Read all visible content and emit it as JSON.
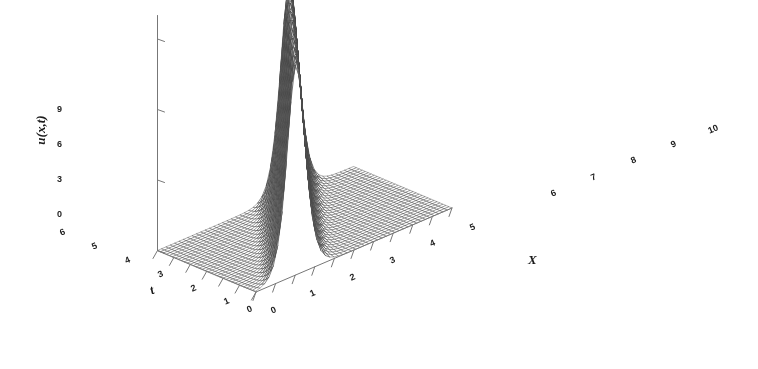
{
  "figure": {
    "type": "3d-surface-mesh",
    "background_color": "#ffffff",
    "mesh_color": "#4a4a4a",
    "axis_color": "#777777",
    "width": 758,
    "height": 369
  },
  "axes": {
    "z": {
      "label": "u(x,t)",
      "ticks": [
        "9",
        "6",
        "3",
        "0"
      ],
      "tick_values": [
        9,
        6,
        3,
        0
      ],
      "range": [
        0,
        10
      ]
    },
    "x": {
      "label": "X",
      "ticks": [
        "0",
        "1",
        "2",
        "3",
        "4",
        "5",
        "6",
        "7",
        "8",
        "9",
        "10"
      ],
      "tick_values": [
        0,
        1,
        2,
        3,
        4,
        5,
        6,
        7,
        8,
        9,
        10
      ],
      "range": [
        0,
        10
      ]
    },
    "t": {
      "label": "t",
      "ticks": [
        "0",
        "1",
        "2",
        "3",
        "4",
        "5",
        "6"
      ],
      "tick_values": [
        0,
        1,
        2,
        3,
        4,
        5,
        6
      ],
      "range": [
        0,
        6
      ]
    }
  },
  "chart_data": {
    "type": "surface",
    "title": "",
    "xlabel": "X",
    "ylabel": "t",
    "zlabel": "u(x,t)",
    "xlim": [
      0,
      10
    ],
    "ylim": [
      0,
      6
    ],
    "zlim": [
      0,
      10
    ],
    "grid": true,
    "legend": "none",
    "surface_model": "soliton_sech2",
    "parameters": {
      "amplitude": 9.0,
      "width": 0.62,
      "speed": 0.78,
      "x0": 2.05
    },
    "nx": 46,
    "nt": 34,
    "x_grid_step": 0.2222,
    "t_grid_step": 0.1818,
    "peak_track": [
      {
        "t": 0,
        "x": 2.05,
        "u": 9.0
      },
      {
        "t": 1,
        "x": 2.83,
        "u": 9.0
      },
      {
        "t": 2,
        "x": 3.61,
        "u": 9.0
      },
      {
        "t": 3,
        "x": 4.39,
        "u": 9.0
      },
      {
        "t": 4,
        "x": 5.17,
        "u": 9.0
      },
      {
        "t": 5,
        "x": 5.95,
        "u": 9.0
      },
      {
        "t": 6,
        "x": 6.73,
        "u": 9.0
      }
    ],
    "baseline_value": 0
  },
  "projection": {
    "origin_px": [
      256,
      292
    ],
    "x_axis_vector_px": [
      196.0,
      -84.0
    ],
    "t_axis_vector_px": [
      -98.5,
      -41.5
    ],
    "z_axis_vector_px": [
      0,
      -23.5
    ]
  }
}
